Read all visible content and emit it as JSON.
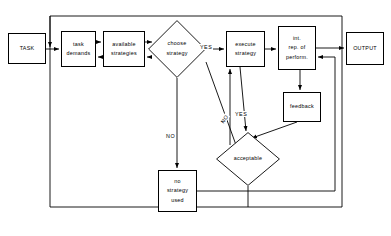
{
  "diagram": {
    "line_color": "#000000",
    "background": "#ffffff",
    "nodes": [
      {
        "id": "task",
        "label": "TASK",
        "shape": "box",
        "x": 8,
        "y": 33,
        "w": 38,
        "h": 31
      },
      {
        "id": "task_demands",
        "label": "task\ndemands",
        "shape": "box",
        "x": 61,
        "y": 31,
        "w": 35,
        "h": 36
      },
      {
        "id": "available",
        "label": "available\nstrategies",
        "shape": "box",
        "x": 103,
        "y": 31,
        "w": 42,
        "h": 36
      },
      {
        "id": "choose",
        "label": "choose\nstrategy",
        "shape": "diamond",
        "cx": 177,
        "cy": 49,
        "rx": 29,
        "ry": 29
      },
      {
        "id": "execute",
        "label": "execute\nstrategy",
        "shape": "box",
        "x": 226,
        "y": 31,
        "w": 39,
        "h": 36
      },
      {
        "id": "int_rep",
        "label": "int.\nrep. of\nperform.",
        "shape": "box",
        "x": 278,
        "y": 26,
        "w": 38,
        "h": 44
      },
      {
        "id": "output",
        "label": "OUTPUT",
        "shape": "box",
        "x": 346,
        "y": 32,
        "w": 38,
        "h": 33
      },
      {
        "id": "feedback",
        "label": "feedback",
        "shape": "box",
        "x": 283,
        "y": 92,
        "w": 38,
        "h": 30
      },
      {
        "id": "acceptable",
        "label": "acceptable",
        "shape": "diamond",
        "cx": 248,
        "cy": 159,
        "rx": 32,
        "ry": 27
      },
      {
        "id": "no_strategy",
        "label": "no\nstrategy\nused",
        "shape": "box",
        "x": 158,
        "y": 170,
        "w": 39,
        "h": 42
      }
    ],
    "edge_labels": [
      {
        "id": "yes-choose-execute",
        "text": "YES",
        "x": 199,
        "y": 44,
        "rotation": 0
      },
      {
        "id": "no-choose-nostrategy",
        "text": "NO",
        "x": 165,
        "y": 133,
        "rotation": 0
      },
      {
        "id": "no-choose-acceptable",
        "text": "NO",
        "x": 219,
        "y": 116,
        "rotation": -55
      },
      {
        "id": "yes-acceptable-execute",
        "text": "YES",
        "x": 234,
        "y": 111,
        "rotation": 0
      }
    ],
    "edges": [
      {
        "id": "task-to-demands",
        "from": "TASK",
        "to": "task demands",
        "arrow": "single"
      },
      {
        "id": "demands-to-available",
        "from": "task demands",
        "to": "available strategies",
        "arrow": "single"
      },
      {
        "id": "available-to-demands",
        "from": "available strategies",
        "to": "task demands",
        "arrow": "single"
      },
      {
        "id": "available-to-choose",
        "from": "available strategies",
        "to": "choose strategy",
        "arrow": "single"
      },
      {
        "id": "choose-to-available",
        "from": "choose strategy",
        "to": "available strategies",
        "arrow": "single"
      },
      {
        "id": "choose-to-execute",
        "from": "choose strategy",
        "to": "execute strategy",
        "arrow": "single",
        "label": "YES"
      },
      {
        "id": "choose-to-nostrategy",
        "from": "choose strategy",
        "to": "no strategy used",
        "arrow": "single",
        "label": "NO"
      },
      {
        "id": "execute-to-intrep",
        "from": "execute strategy",
        "to": "int. rep. of perform.",
        "arrow": "single"
      },
      {
        "id": "intrep-to-output",
        "from": "int. rep. of perform.",
        "to": "OUTPUT",
        "arrow": "single"
      },
      {
        "id": "intrep-to-feedback",
        "from": "int. rep. of perform.",
        "to": "feedback",
        "arrow": "single"
      },
      {
        "id": "feedback-to-acceptable",
        "from": "feedback",
        "to": "acceptable",
        "arrow": "single"
      },
      {
        "id": "execute-to-acceptable",
        "from": "execute strategy",
        "to": "acceptable",
        "arrow": "single",
        "label": "NO"
      },
      {
        "id": "acceptable-to-execute",
        "from": "acceptable",
        "to": "execute strategy",
        "arrow": "single",
        "label": "YES"
      },
      {
        "id": "acceptable-to-top-loop",
        "from": "acceptable",
        "to": "task demands",
        "arrow": "single"
      },
      {
        "id": "nostrategy-to-intrep",
        "from": "no strategy used",
        "to": "int. rep. of perform.",
        "arrow": "single"
      }
    ]
  }
}
